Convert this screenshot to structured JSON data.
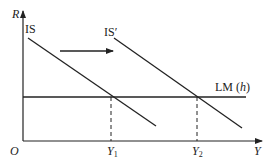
{
  "diagram": {
    "axes": {
      "y_label": "R",
      "x_label": "Y",
      "origin_label": "O"
    },
    "curves": {
      "is": {
        "label": "IS"
      },
      "is_prime": {
        "label": "IS′"
      },
      "lm": {
        "label": "LM (h)"
      }
    },
    "equilibria": {
      "y1": {
        "label": "Y",
        "sub": "1"
      },
      "y2": {
        "label": "Y",
        "sub": "2"
      }
    },
    "shift_arrow": {
      "direction": "right"
    },
    "colors": {
      "line": "#222222",
      "background": "#ffffff"
    }
  }
}
